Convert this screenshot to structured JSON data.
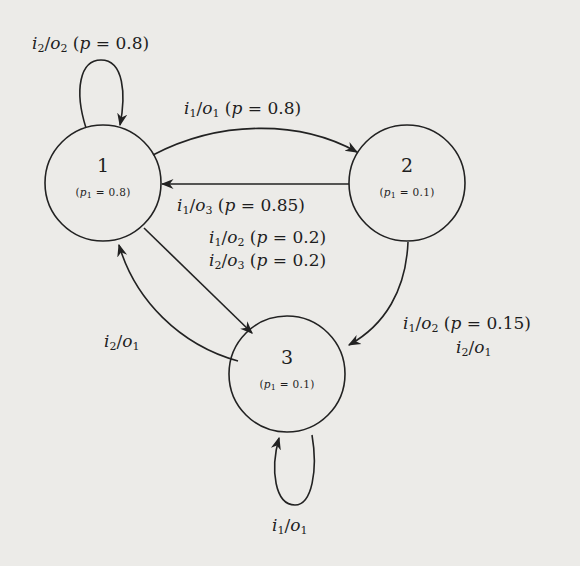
{
  "diagram": {
    "type": "probabilistic finite state machine",
    "background_color": "#ecebe8",
    "stroke_color": "#222222",
    "nodes": [
      {
        "id": "1",
        "label": "1",
        "prob_label": "(p1 = 0.8)",
        "prob_var": "p",
        "prob_sub": "1",
        "prob_value": "0.8",
        "cx": 103,
        "cy": 183,
        "r": 58
      },
      {
        "id": "2",
        "label": "2",
        "prob_label": "(p1 = 0.1)",
        "prob_var": "p",
        "prob_sub": "1",
        "prob_value": "0.1",
        "cx": 407,
        "cy": 183,
        "r": 58
      },
      {
        "id": "3",
        "label": "3",
        "prob_label": "(p1 = 0.1)",
        "prob_var": "p",
        "prob_sub": "1",
        "prob_value": "0.1",
        "cx": 287,
        "cy": 374,
        "r": 58
      }
    ],
    "edges": [
      {
        "from": "1",
        "to": "1",
        "labels": [
          "i2/o2 (p = 0.8)"
        ]
      },
      {
        "from": "1",
        "to": "2",
        "labels": [
          "i1/o1 (p = 0.8)"
        ]
      },
      {
        "from": "2",
        "to": "1",
        "labels": [
          "i1/o3 (p = 0.85)"
        ]
      },
      {
        "from": "1",
        "to": "3",
        "labels": [
          "i1/o2 (p = 0.2)",
          "i2/o3 (p = 0.2)"
        ]
      },
      {
        "from": "3",
        "to": "1",
        "labels": [
          "i2/o1"
        ]
      },
      {
        "from": "2",
        "to": "3",
        "labels": [
          "i1/o2 (p = 0.15)",
          "i2/o1"
        ]
      },
      {
        "from": "3",
        "to": "3",
        "labels": [
          "i1/o1"
        ]
      }
    ],
    "edge_labels": {
      "loop1": {
        "i": "2",
        "o": "2",
        "p": "0.8"
      },
      "e12": {
        "i": "1",
        "o": "1",
        "p": "0.8"
      },
      "e21": {
        "i": "1",
        "o": "3",
        "p": "0.85"
      },
      "e13a": {
        "i": "1",
        "o": "2",
        "p": "0.2"
      },
      "e13b": {
        "i": "2",
        "o": "3",
        "p": "0.2"
      },
      "e31": {
        "i": "2",
        "o": "1"
      },
      "e23a": {
        "i": "1",
        "o": "2",
        "p": "0.15"
      },
      "e23b": {
        "i": "2",
        "o": "1"
      },
      "loop3": {
        "i": "1",
        "o": "1"
      }
    },
    "symbols": {
      "input": "i",
      "output": "o",
      "prob": "p",
      "eq": " = ",
      "slash": "/",
      "open": " (",
      "close": ")"
    }
  }
}
